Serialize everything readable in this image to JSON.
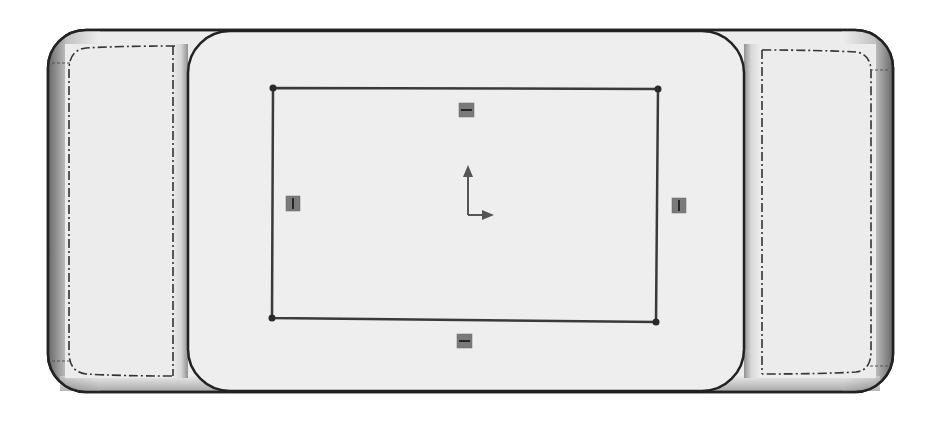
{
  "viewport": {
    "view": "CAD sketch view",
    "background": "#ffffff"
  },
  "colors": {
    "body_fill": "#ececec",
    "plate_fill": "#eeeeee",
    "outline": "#222222",
    "sketch_line": "#3a3a3a",
    "constraint_fill": "#7a7a7a",
    "constraint_glyph": "#1e1e1e",
    "origin_arrow": "#555555",
    "hidden_line": "#333333"
  },
  "model": {
    "outer_body": {
      "name": "base-body",
      "x": 48,
      "y": 30,
      "width": 845,
      "height": 360,
      "corner_radius": 38
    },
    "left_tab": {
      "name": "left-tab",
      "dashed_outline": true
    },
    "right_tab": {
      "name": "right-tab",
      "dashed_outline": true
    },
    "center_plate": {
      "name": "center-plate",
      "x": 188,
      "y": 30,
      "width": 556,
      "height": 360,
      "corner_radius": 40
    }
  },
  "sketch": {
    "rectangle": {
      "corners": [
        [
          273,
          88
        ],
        [
          658,
          89
        ],
        [
          656,
          322
        ],
        [
          272,
          318
        ]
      ]
    },
    "constraints": [
      {
        "name": "horizontal-constraint-top",
        "glyph": "horizontal",
        "x": 466,
        "y": 110
      },
      {
        "name": "horizontal-constraint-bottom",
        "glyph": "horizontal",
        "x": 465,
        "y": 341
      },
      {
        "name": "vertical-constraint-left",
        "glyph": "vertical",
        "x": 293,
        "y": 203
      },
      {
        "name": "vertical-constraint-right",
        "glyph": "vertical",
        "x": 679,
        "y": 205
      }
    ],
    "origin": {
      "x": 468,
      "y": 215
    }
  }
}
